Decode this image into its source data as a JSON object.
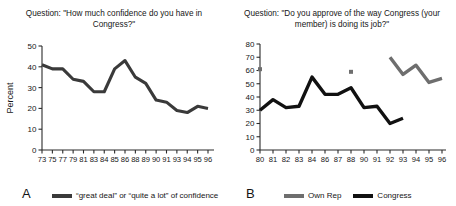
{
  "figure": {
    "background": "#ffffff",
    "axis_color": "#2b2b2b",
    "text_color": "#161616"
  },
  "panels": [
    {
      "letter": "A",
      "title": "Question: \"How much confidence do you have in Congress?\"",
      "ylabel": "Percent",
      "legend": [
        {
          "label": "“great deal” or “quite a lot” of confidence",
          "color": "#3a3a3a"
        }
      ]
    },
    {
      "letter": "B",
      "title": "Question: \"Do you approve of the way Congress (your member) is doing its job?\"",
      "ylabel": "",
      "legend": [
        {
          "label": "Own Rep",
          "color": "#6e6e6e"
        },
        {
          "label": "Congress",
          "color": "#111111"
        }
      ]
    }
  ],
  "chart_data": [
    {
      "type": "line",
      "panel": "A",
      "title": "Question: \"How much confidence do you have in Congress?\"",
      "xlabel": "",
      "ylabel": "Percent",
      "ylim": [
        0,
        50
      ],
      "yticks": [
        0,
        10,
        20,
        30,
        40,
        50
      ],
      "grid": false,
      "legend_position": "below",
      "categories": [
        "73",
        "75",
        "77",
        "79",
        "81",
        "83",
        "84",
        "85",
        "86",
        "88",
        "89",
        "90",
        "91",
        "93",
        "94",
        "95",
        "96"
      ],
      "series": [
        {
          "name": "“great deal” or “quite a lot” of confidence",
          "color": "#3a3a3a",
          "values": [
            41,
            39,
            39,
            34,
            33,
            28,
            28,
            39,
            43,
            35,
            32,
            24,
            23,
            19,
            18,
            21,
            20
          ]
        }
      ]
    },
    {
      "type": "line",
      "panel": "B",
      "title": "Question: \"Do you approve of the way Congress (your member) is doing its job?\"",
      "xlabel": "",
      "ylabel": "",
      "ylim": [
        0,
        80
      ],
      "yticks": [
        0,
        10,
        20,
        30,
        40,
        50,
        60,
        70,
        80
      ],
      "grid": false,
      "legend_position": "below",
      "categories": [
        "80",
        "81",
        "82",
        "83",
        "84",
        "86",
        "87",
        "88",
        "90",
        "91",
        "92",
        "93",
        "94",
        "95",
        "96"
      ],
      "series": [
        {
          "name": "Congress",
          "color": "#111111",
          "values": [
            30,
            38,
            32,
            33,
            55,
            42,
            42,
            47,
            32,
            33,
            20,
            24,
            null,
            null,
            null
          ]
        },
        {
          "name": "Own Rep",
          "color": "#6e6e6e",
          "values": [
            61,
            null,
            null,
            null,
            null,
            null,
            null,
            59,
            null,
            null,
            70,
            57,
            64,
            51,
            54
          ]
        }
      ]
    }
  ]
}
